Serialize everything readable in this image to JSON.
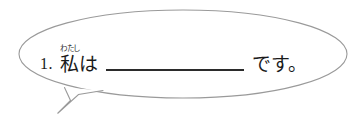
{
  "exercise": {
    "item_number": "1.",
    "ruby": {
      "base": "私",
      "reading": "わたし"
    },
    "particle": "は",
    "blank": "",
    "copula": "です。",
    "full_text": "1. 私（わたし）は ＿＿＿＿＿＿ です。"
  },
  "bubble": {
    "shape": "ellipse-speech-bubble",
    "stroke_color": "#9a9a9a",
    "fill_color": "#ffffff",
    "tail_direction": "down-left"
  },
  "colors": {
    "background": "#ffffff",
    "text": "#1a1a1a",
    "blank_line": "#2b2b2b",
    "outline": "#9a9a9a"
  }
}
